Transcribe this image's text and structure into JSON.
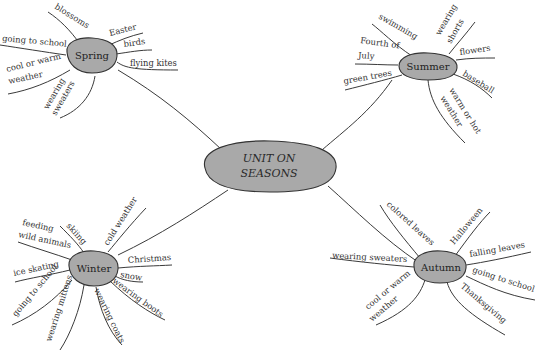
{
  "diagram": {
    "type": "mind-map",
    "center": {
      "label_line1": "UNIT ON",
      "label_line2": "SEASONS"
    },
    "colors": {
      "node_fill": "#a9a9a9",
      "line": "#3a3a3a",
      "text": "#333333",
      "background": "#ffffff"
    },
    "branches": [
      {
        "name": "Spring",
        "items": [
          "blossoms",
          "Easter",
          "birds",
          "flying kites",
          "going to school",
          "cool or warm",
          "weather",
          "wearing",
          "sweaters"
        ]
      },
      {
        "name": "Summer",
        "items": [
          "swimming",
          "wearing",
          "shorts",
          "Fourth of",
          "July",
          "flowers",
          "green trees",
          "baseball",
          "warm or hot",
          "weather"
        ]
      },
      {
        "name": "Winter",
        "items": [
          "feeding",
          "wild animals",
          "skiing",
          "cold weather",
          "Christmas",
          "snow",
          "ice skating",
          "going to school",
          "wearing mittens",
          "wearing coats",
          "wearing boots"
        ]
      },
      {
        "name": "Autumn",
        "items": [
          "colored leaves",
          "Halloween",
          "falling leaves",
          "wearing sweaters",
          "going to school",
          "cool or warm",
          "weather",
          "Thanksgiving"
        ]
      }
    ]
  }
}
